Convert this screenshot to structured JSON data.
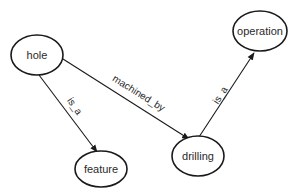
{
  "diagram": {
    "type": "semantic-network",
    "nodes": [
      {
        "id": "hole",
        "label": "hole"
      },
      {
        "id": "operation",
        "label": "operation"
      },
      {
        "id": "feature",
        "label": "feature"
      },
      {
        "id": "drilling",
        "label": "drilling"
      }
    ],
    "edges": [
      {
        "from": "hole",
        "to": "drilling",
        "label": "machined_by"
      },
      {
        "from": "hole",
        "to": "feature",
        "label": "is_a"
      },
      {
        "from": "drilling",
        "to": "operation",
        "label": "is_a"
      }
    ]
  }
}
